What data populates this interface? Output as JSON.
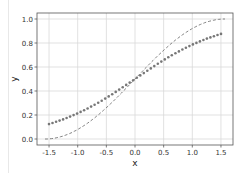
{
  "chart_data": {
    "type": "line",
    "title": "",
    "xlabel": "x",
    "ylabel": "y",
    "xlim": [
      -1.71,
      1.71
    ],
    "ylim": [
      -0.05,
      1.05
    ],
    "grid": true,
    "legend": null,
    "xticks": [
      -1.5,
      -1.0,
      -0.5,
      0.0,
      0.5,
      1.0,
      1.5
    ],
    "xtick_labels": [
      "-1.5",
      "-1.0",
      "-0.5",
      "0.0",
      "0.5",
      "1.0",
      "1.5"
    ],
    "yticks": [
      0.0,
      0.2,
      0.4,
      0.6,
      0.8,
      1.0
    ],
    "ytick_labels": [
      "0.0",
      "0.2",
      "0.4",
      "0.6",
      "0.8",
      "1.0"
    ],
    "series": [
      {
        "name": "dashed curve",
        "style": "dashed",
        "color": "#777777",
        "x": [
          -1.5708,
          -1.25,
          -1.0,
          -0.75,
          -0.5,
          -0.25,
          0.0,
          0.25,
          0.5,
          0.75,
          1.0,
          1.25,
          1.5708
        ],
        "y": [
          0.0,
          0.025,
          0.079,
          0.159,
          0.26,
          0.376,
          0.5,
          0.624,
          0.74,
          0.841,
          0.921,
          0.975,
          1.0
        ]
      },
      {
        "name": "dotted markers",
        "style": "markers",
        "color": "#777777",
        "x": [
          -1.5,
          -1.25,
          -1.0,
          -0.75,
          -0.5,
          -0.25,
          0.0,
          0.25,
          0.5,
          0.75,
          1.0,
          1.25,
          1.5
        ],
        "y": [
          0.12,
          0.16,
          0.21,
          0.27,
          0.34,
          0.42,
          0.5,
          0.58,
          0.66,
          0.73,
          0.79,
          0.84,
          0.88
        ]
      }
    ]
  }
}
